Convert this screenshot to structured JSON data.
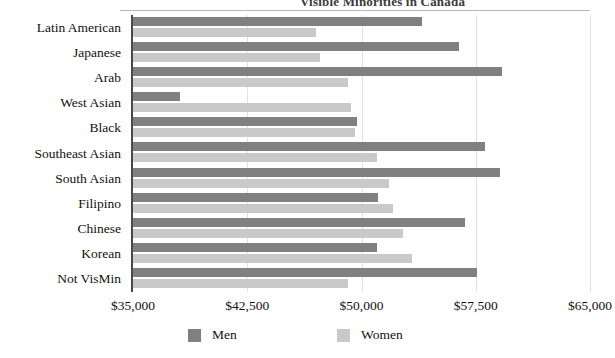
{
  "chart_data": {
    "type": "bar",
    "orientation": "horizontal",
    "title": "",
    "xlabel": "",
    "ylabel": "",
    "xlim": [
      35000,
      65000
    ],
    "xticks": [
      35000,
      42500,
      50000,
      57500,
      65000
    ],
    "xtick_labels": [
      "$35,000",
      "$42,500",
      "$50,000",
      "$57,500",
      "$65,000"
    ],
    "grid": true,
    "legend_position": "bottom",
    "categories": [
      "Latin American",
      "Japanese",
      "Arab",
      "West Asian",
      "Black",
      "Southeast Asian",
      "South Asian",
      "Filipino",
      "Chinese",
      "Korean",
      "Not VisMin"
    ],
    "series": [
      {
        "name": "Men",
        "color": "#808080",
        "values": [
          54000,
          56400,
          59200,
          38100,
          49700,
          58100,
          59100,
          51100,
          56800,
          51000,
          57600
        ]
      },
      {
        "name": "Women",
        "color": "#c9c9c9",
        "values": [
          47000,
          47300,
          49100,
          49300,
          49600,
          51000,
          51800,
          52100,
          52700,
          53300,
          49100
        ]
      }
    ]
  },
  "legend": {
    "men_label": "Men",
    "women_label": "Women"
  },
  "header": {
    "clipped_title": "Visible Minorities in Canada"
  }
}
